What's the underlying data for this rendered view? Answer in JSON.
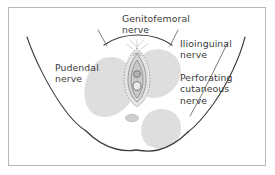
{
  "figure": {
    "view": "perineal cross-section, lithotomy view",
    "background_color": "#ffffff",
    "frame_color": "#b9b9b9",
    "outline_color": "#3c3c3c",
    "shade_color": "#dcdcdc",
    "text_color": "#3a3a3a"
  },
  "labels": [
    {
      "id": "genitofemoral",
      "name": "genitofemoral-nerve-label",
      "text": "Genitofemoral\nnerve",
      "position": "top-center"
    },
    {
      "id": "ilioinguinal",
      "name": "ilioinguinal-nerve-label",
      "text": "Ilioinguinal\nnerve",
      "position": "right-upper"
    },
    {
      "id": "perforating",
      "name": "perforating-cutaneous-nerve-label",
      "text": "Perforating\ncutaneous\nnerve",
      "position": "right-lower"
    },
    {
      "id": "pudendal",
      "name": "pudendal-nerve-label",
      "text": "Pudendal\nnerve",
      "position": "left-center"
    }
  ],
  "anatomy": {
    "regions": [
      {
        "name": "left-pudendal-territory",
        "fill": "#dcdcdc"
      },
      {
        "name": "right-ilioinguinal-territory",
        "fill": "#dcdcdc"
      },
      {
        "name": "right-perforating-cutaneous-territory",
        "fill": "#dcdcdc"
      },
      {
        "name": "vulva-labia-structure",
        "fill": "#d4d4d4"
      },
      {
        "name": "anus-oval",
        "fill": "#c9c9c9"
      }
    ],
    "outlines": [
      {
        "name": "left-thigh-outline"
      },
      {
        "name": "right-thigh-outline"
      },
      {
        "name": "mons-pubis-outline"
      },
      {
        "name": "left-buttock-outline"
      },
      {
        "name": "right-buttock-outline"
      }
    ]
  },
  "leader_lines": [
    {
      "name": "genitofemoral-leader-left"
    },
    {
      "name": "genitofemoral-leader-right"
    },
    {
      "name": "perforating-cutaneous-leader"
    }
  ]
}
